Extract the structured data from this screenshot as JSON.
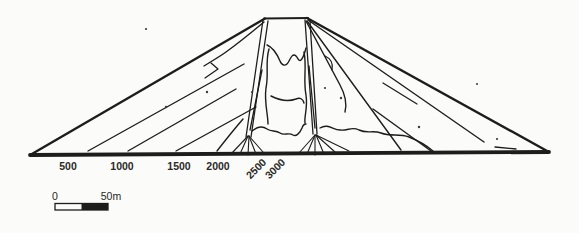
{
  "figure": {
    "name": "Embankment dam cross-section diagram",
    "axis_tick_labels": [
      "500",
      "1000",
      "1500",
      "2000",
      "2500",
      "3000"
    ],
    "scale_bar": {
      "start_label": "0",
      "end_label": "50m"
    }
  },
  "colors": {
    "ink": "#1d1d1b",
    "paper": "#fbfbf9"
  }
}
